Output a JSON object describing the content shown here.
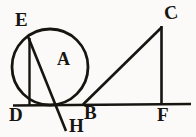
{
  "figure": {
    "background_color": "#fbfaf8",
    "ink_color": "#17150f",
    "labels": {
      "E": "E",
      "A": "A",
      "D": "D",
      "B": "B",
      "H": "H",
      "C": "C",
      "F": "F"
    },
    "points": {
      "E": {
        "x": 29,
        "y": 38
      },
      "A": {
        "x": 50,
        "y": 67
      },
      "D": {
        "x": 29,
        "y": 105
      },
      "B": {
        "x": 84,
        "y": 104
      },
      "H": {
        "x": 66,
        "y": 131
      },
      "C": {
        "x": 162,
        "y": 27
      },
      "F": {
        "x": 162,
        "y": 105
      }
    },
    "circle": {
      "center_x": 50,
      "center_y": 67,
      "radius": 38
    },
    "segments": [
      {
        "name": "baseline-DF",
        "from": "D-left-extension",
        "to": "F-right-extension"
      },
      {
        "name": "segment-ED",
        "from": "E",
        "to": "D"
      },
      {
        "name": "segment-DB",
        "from": "D",
        "to": "B"
      },
      {
        "name": "segment-EB",
        "from": "E",
        "to": "B"
      },
      {
        "name": "segment-BH",
        "from": "B",
        "to": "H"
      },
      {
        "name": "segment-BC",
        "from": "B",
        "to": "C"
      },
      {
        "name": "segment-CF",
        "from": "C",
        "to": "F"
      }
    ]
  }
}
